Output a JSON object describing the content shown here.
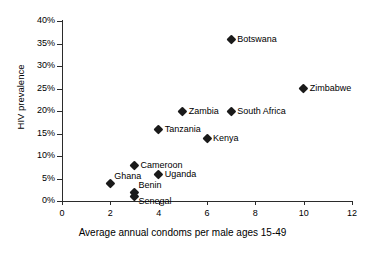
{
  "chart_data": {
    "type": "scatter",
    "title": "",
    "xlabel": "Average annual condoms per male ages 15-49",
    "ylabel": "HIV prevalence",
    "xlim": [
      0,
      12
    ],
    "ylim": [
      0,
      40
    ],
    "grid": false,
    "legend": "none",
    "xticks": [
      "0",
      "2",
      "4",
      "6",
      "8",
      "10",
      "12"
    ],
    "xtick_values": [
      0,
      2,
      4,
      6,
      8,
      10,
      12
    ],
    "yticks": [
      "0%",
      "5%",
      "10%",
      "15%",
      "20%",
      "25%",
      "30%",
      "35%",
      "40%"
    ],
    "ytick_values": [
      0,
      5,
      10,
      15,
      20,
      25,
      30,
      35,
      40
    ],
    "points": [
      {
        "label": "Botswana",
        "x": 7,
        "y": 36,
        "label_pos": "right"
      },
      {
        "label": "Zimbabwe",
        "x": 10,
        "y": 25,
        "label_pos": "right"
      },
      {
        "label": "Zambia",
        "x": 5,
        "y": 20,
        "label_pos": "right"
      },
      {
        "label": "South Africa",
        "x": 7,
        "y": 20,
        "label_pos": "right"
      },
      {
        "label": "Tanzania",
        "x": 4,
        "y": 16,
        "label_pos": "right"
      },
      {
        "label": "Kenya",
        "x": 6,
        "y": 14,
        "label_pos": "right"
      },
      {
        "label": "Cameroon",
        "x": 3,
        "y": 8,
        "label_pos": "right"
      },
      {
        "label": "Uganda",
        "x": 4,
        "y": 6,
        "label_pos": "right"
      },
      {
        "label": "Ghana",
        "x": 2,
        "y": 4,
        "label_pos": "above-right"
      },
      {
        "label": "Benin",
        "x": 3,
        "y": 2,
        "label_pos": "above-right"
      },
      {
        "label": "Senegal",
        "x": 3,
        "y": 1,
        "label_pos": "below-right"
      }
    ]
  },
  "colors": {
    "marker": "#1a1a1a",
    "axis": "#2b2b2b",
    "background": "#ffffff"
  }
}
